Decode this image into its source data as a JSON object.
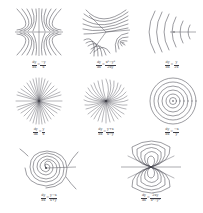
{
  "figure": {
    "background_color": "#ffffff",
    "line_color": "#4a4a52",
    "caption_color": "#3c3c44",
    "columns": 3,
    "rows": 3
  },
  "panels": [
    {
      "id": "panel-1",
      "name": "saddle-quadrupole",
      "pattern": "saddle",
      "description": "Hyperbolic saddle flow with horizontal and vertical separatrices crossing at center",
      "caption": {
        "lhs": "dy",
        "lhs_den": "dx",
        "op": "=",
        "num": "−y",
        "den": "x"
      }
    },
    {
      "id": "panel-2",
      "name": "threefold-saddle",
      "pattern": "threefold",
      "description": "Three-fold symmetric flow with three separatrix arms from the center",
      "caption": {
        "lhs": "dy",
        "lhs_den": "dx",
        "op": "=",
        "num": "x²−y²",
        "den": "2xy"
      }
    },
    {
      "id": "panel-3",
      "name": "parabolic-arcs",
      "pattern": "parabolic",
      "description": "Nested parabolic arcs opening to the right about a horizontal axis",
      "caption": {
        "lhs": "dy",
        "lhs_den": "dx",
        "op": "=",
        "num": "y",
        "den": "2x"
      }
    },
    {
      "id": "panel-4",
      "name": "radial-star-node",
      "pattern": "radial",
      "description": "Straight radial rays emanating from a central node",
      "caption": {
        "lhs": "dy",
        "lhs_den": "dx",
        "op": "=",
        "num": "y",
        "den": "x"
      }
    },
    {
      "id": "panel-5",
      "name": "spiral-pinwheel",
      "pattern": "pinwheel",
      "description": "Curved pinwheel rays spiralling outward from the center",
      "caption": {
        "lhs": "dy",
        "lhs_den": "dx",
        "op": "=",
        "num": "y+x",
        "den": "x−y"
      }
    },
    {
      "id": "panel-6",
      "name": "concentric-center",
      "pattern": "concentric",
      "description": "Concentric closed circles about a central point (a center)",
      "caption": {
        "lhs": "dy",
        "lhs_den": "dx",
        "op": "=",
        "num": "−x",
        "den": "y"
      }
    },
    {
      "id": "panel-7",
      "name": "spiral-focus",
      "pattern": "spiral",
      "description": "Logarithmic spirals winding into a focus, with an incoming horizontal line",
      "caption": {
        "lhs": "dy",
        "lhs_den": "dx",
        "op": "=",
        "num": "y−x",
        "den": "x+y"
      }
    },
    {
      "id": "panel-8",
      "name": "dipole-field",
      "pattern": "dipole",
      "description": "Dipole field lines forming nested loops above and below a horizontal axis",
      "caption": {
        "lhs": "dy",
        "lhs_den": "dx",
        "op": "=",
        "num": "2xy",
        "den": "x²−y²"
      }
    }
  ]
}
